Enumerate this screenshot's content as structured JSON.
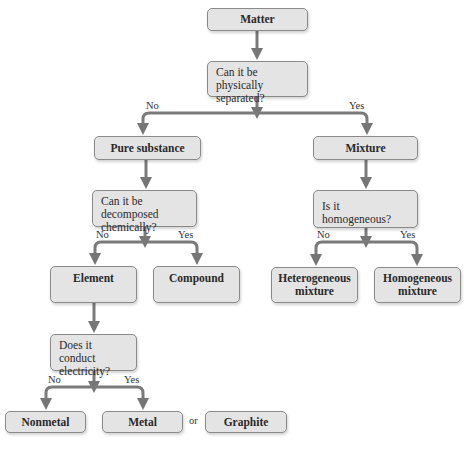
{
  "diagram": {
    "type": "flowchart",
    "nodes": {
      "matter": "Matter",
      "q_physical": "Can it be physically separated?",
      "pure_substance": "Pure substance",
      "mixture": "Mixture",
      "q_decompose": "Can it be decomposed chemically?",
      "q_homogeneous": "Is it homogeneous?",
      "element": "Element",
      "compound": "Compound",
      "heterogeneous": "Heterogeneous mixture",
      "homogeneous": "Homogeneous mixture",
      "q_conduct": "Does it conduct electricity?",
      "nonmetal": "Nonmetal",
      "metal": "Metal",
      "graphite": "Graphite"
    },
    "labels": {
      "no": "No",
      "yes": "Yes",
      "or": "or"
    },
    "edges": [
      {
        "from": "matter",
        "to": "q_physical"
      },
      {
        "from": "q_physical",
        "to": "pure_substance",
        "label": "No"
      },
      {
        "from": "q_physical",
        "to": "mixture",
        "label": "Yes"
      },
      {
        "from": "pure_substance",
        "to": "q_decompose"
      },
      {
        "from": "mixture",
        "to": "q_homogeneous"
      },
      {
        "from": "q_decompose",
        "to": "element",
        "label": "No"
      },
      {
        "from": "q_decompose",
        "to": "compound",
        "label": "Yes"
      },
      {
        "from": "q_homogeneous",
        "to": "heterogeneous",
        "label": "No"
      },
      {
        "from": "q_homogeneous",
        "to": "homogeneous",
        "label": "Yes"
      },
      {
        "from": "element",
        "to": "q_conduct"
      },
      {
        "from": "q_conduct",
        "to": "nonmetal",
        "label": "No"
      },
      {
        "from": "q_conduct",
        "to": "metal",
        "label": "Yes"
      }
    ],
    "colors": {
      "box_fill": "#e4e4e4",
      "box_border": "#8a8a8a",
      "arrow": "#7a7a7a"
    }
  }
}
